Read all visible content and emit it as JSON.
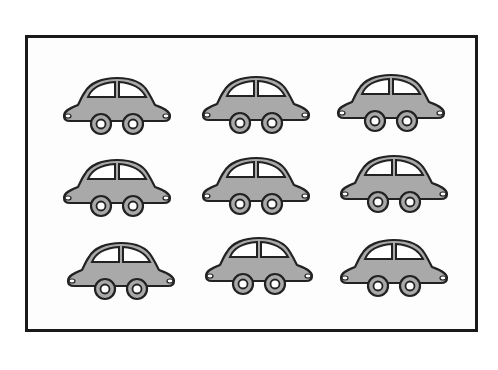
{
  "figure": {
    "rows": 3,
    "columns": 3,
    "total_cars": 9,
    "colors": {
      "frame_border": "#1a1a1a",
      "car_body": "#a9a9a9",
      "car_outline": "#222222",
      "window": "#ffffff",
      "background": "#ffffff"
    }
  },
  "cars": [
    {
      "row": 1,
      "col": 1,
      "x": 60,
      "y": 75
    },
    {
      "row": 1,
      "col": 2,
      "x": 199,
      "y": 74
    },
    {
      "row": 1,
      "col": 3,
      "x": 334,
      "y": 72
    },
    {
      "row": 2,
      "col": 1,
      "x": 60,
      "y": 157
    },
    {
      "row": 2,
      "col": 2,
      "x": 199,
      "y": 155
    },
    {
      "row": 2,
      "col": 3,
      "x": 337,
      "y": 153
    },
    {
      "row": 3,
      "col": 1,
      "x": 64,
      "y": 240
    },
    {
      "row": 3,
      "col": 2,
      "x": 202,
      "y": 235
    },
    {
      "row": 3,
      "col": 3,
      "x": 337,
      "y": 237
    }
  ]
}
